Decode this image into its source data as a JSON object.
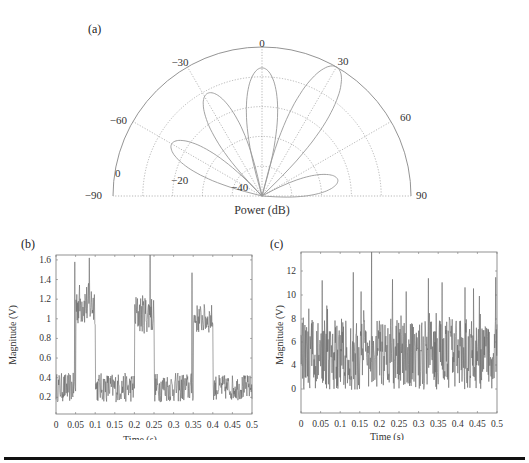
{
  "figure": {
    "panels": {
      "a": {
        "label": "(a)"
      },
      "b": {
        "label": "(b)"
      },
      "c": {
        "label": "(c)"
      }
    }
  },
  "chart_data": [
    {
      "panel": "(a)",
      "type": "polar",
      "title": "",
      "xlabel": "Power (dB)",
      "angle_ticks": [
        "-90",
        "-60",
        "-30",
        "0",
        "30",
        "60",
        "90"
      ],
      "radial_ticks": [
        "-40",
        "-20",
        "0"
      ],
      "radial_range_db": [
        -50,
        0
      ],
      "angle_range_deg": [
        -90,
        90
      ],
      "grid": true,
      "lobes_deg_peakdb": [
        {
          "angle": -60,
          "peak_db": -15
        },
        {
          "angle": -28,
          "peak_db": -11
        },
        {
          "angle": 0,
          "peak_db": -7
        },
        {
          "angle": 30,
          "peak_db": 0
        },
        {
          "angle": 78,
          "peak_db": -24
        }
      ]
    },
    {
      "panel": "(b)",
      "type": "line",
      "xlabel": "Time (s)",
      "ylabel": "Magnitude (V)",
      "xticks": [
        "0",
        "0.05",
        "0.1",
        "0.15",
        "0.2",
        "0.25",
        "0.3",
        "0.35",
        "0.4",
        "0.45",
        "0.5"
      ],
      "yticks": [
        "0.2",
        "0.4",
        "0.6",
        "0.8",
        "1",
        "1.2",
        "1.4",
        "1.6"
      ],
      "xlim": [
        0,
        0.5
      ],
      "ylim": [
        0.03,
        1.65
      ],
      "segments": [
        {
          "t_start": 0.0,
          "t_end": 0.05,
          "level": 0.3,
          "noise": 0.15
        },
        {
          "t_start": 0.05,
          "t_end": 0.1,
          "level": 1.15,
          "noise": 0.22
        },
        {
          "t_start": 0.1,
          "t_end": 0.2,
          "level": 0.3,
          "noise": 0.15
        },
        {
          "t_start": 0.2,
          "t_end": 0.25,
          "level": 1.05,
          "noise": 0.2
        },
        {
          "t_start": 0.25,
          "t_end": 0.35,
          "level": 0.3,
          "noise": 0.15
        },
        {
          "t_start": 0.35,
          "t_end": 0.4,
          "level": 1.0,
          "noise": 0.15
        },
        {
          "t_start": 0.4,
          "t_end": 0.5,
          "level": 0.3,
          "noise": 0.13
        }
      ],
      "peaks": [
        {
          "t": 0.048,
          "v": 1.58
        },
        {
          "t": 0.085,
          "v": 1.62
        },
        {
          "t": 0.24,
          "v": 1.65
        },
        {
          "t": 0.347,
          "v": 1.47
        }
      ]
    },
    {
      "panel": "(c)",
      "type": "line",
      "xlabel": "Time (s)",
      "ylabel": "Magnitude (V)",
      "xticks": [
        "0",
        "0.05",
        "0.1",
        "0.15",
        "0.2",
        "0.25",
        "0.3",
        "0.35",
        "0.4",
        "0.45",
        "0.5"
      ],
      "yticks": [
        "0",
        "4",
        "6",
        "8",
        "10",
        "12"
      ],
      "xlim": [
        0,
        0.5
      ],
      "ylim": [
        -2.3,
        13.6
      ],
      "mean_level": 3.5,
      "noise_amplitude": 3.5,
      "peaks": [
        {
          "t": 0.02,
          "v": 8.0
        },
        {
          "t": 0.054,
          "v": 10.8
        },
        {
          "t": 0.133,
          "v": 11.6
        },
        {
          "t": 0.153,
          "v": 9.7
        },
        {
          "t": 0.18,
          "v": 13.6
        },
        {
          "t": 0.233,
          "v": 10.9
        },
        {
          "t": 0.325,
          "v": 11.0
        },
        {
          "t": 0.36,
          "v": 10.6
        },
        {
          "t": 0.418,
          "v": 10.1
        },
        {
          "t": 0.44,
          "v": 10.0
        },
        {
          "t": 0.497,
          "v": 11.1
        }
      ]
    }
  ],
  "caption_rule": true
}
